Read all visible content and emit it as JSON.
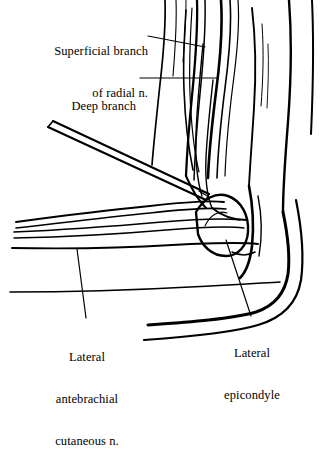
{
  "figure": {
    "type": "anatomical-line-illustration",
    "background_color": "#ffffff",
    "ink_color": "#000000",
    "width": 321,
    "height": 376
  },
  "labels": {
    "superficial_branch": {
      "line1": "Superficial branch",
      "line2": "of radial n."
    },
    "deep_branch": {
      "line1": "Deep branch"
    },
    "lateral_epicondyle": {
      "line1": "Lateral",
      "line2": "epicondyle"
    },
    "lateral_antebrachial": {
      "line1": "Lateral",
      "line2": "antebrachial",
      "line3": "cutaneous n."
    }
  },
  "leaders": [
    {
      "name": "leader-superficial-branch",
      "from": [
        148,
        36
      ],
      "to": [
        205,
        47
      ]
    },
    {
      "name": "leader-deep-branch",
      "from": [
        140,
        78
      ],
      "to": [
        218,
        78
      ]
    },
    {
      "name": "leader-lateral-epicondyle",
      "from": [
        226,
        240
      ],
      "to": [
        251,
        316
      ]
    },
    {
      "name": "leader-lateral-antebrachial",
      "from": [
        77,
        249
      ],
      "to": [
        86,
        318
      ]
    }
  ],
  "structures": [
    {
      "name": "needle",
      "kind": "instrument",
      "description": "double-line hypodermic needle entering from upper-left toward nerve"
    },
    {
      "name": "lateral-epicondyle",
      "kind": "bone",
      "description": "rounded bony prominence of humerus"
    },
    {
      "name": "radial-nerve",
      "kind": "nerve",
      "description": "vertical nerve dividing into superficial and deep branches"
    },
    {
      "name": "lateral-antebrachial-cutaneous-nerve",
      "kind": "nerve",
      "description": "long nerve sweeping across forearm"
    },
    {
      "name": "forearm-contour",
      "kind": "skin-outline"
    },
    {
      "name": "arm-outer-contour",
      "kind": "skin-outline"
    },
    {
      "name": "muscle-striations",
      "kind": "muscle"
    }
  ]
}
